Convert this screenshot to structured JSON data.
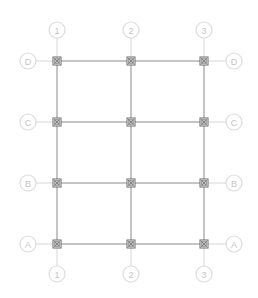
{
  "diagram": {
    "type": "structural-grid-plan",
    "columns": [
      {
        "label": "1",
        "x": 57
      },
      {
        "label": "2",
        "x": 131
      },
      {
        "label": "3",
        "x": 204
      }
    ],
    "rows": [
      {
        "label": "D",
        "y": 61
      },
      {
        "label": "C",
        "y": 122
      },
      {
        "label": "B",
        "y": 183
      },
      {
        "label": "A",
        "y": 244
      }
    ],
    "bubbles": {
      "top_y": 30,
      "bottom_y": 274,
      "left_x": 28,
      "right_x": 234,
      "radius": 8
    },
    "colors": {
      "grid_line": "#8a8a8a",
      "bubble_stroke": "#dcdcdc",
      "bubble_text": "#c4c4c4",
      "column_marker": "#6a6a6a"
    }
  }
}
